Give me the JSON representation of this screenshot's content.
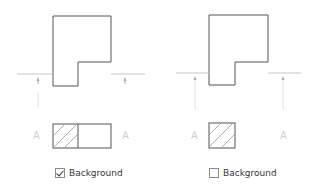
{
  "panels": [
    {
      "id": "with-background",
      "section_label_left": "A",
      "section_label_right": "A",
      "checkbox": {
        "label": "Background",
        "checked": true
      }
    },
    {
      "id": "without-background",
      "section_label_left": "A",
      "section_label_right": "A",
      "checkbox": {
        "label": "Background",
        "checked": false
      }
    }
  ],
  "colors": {
    "outline": "#555555",
    "section_line": "#c8c8c8",
    "label": "#d0d0d0",
    "hatch": "#999999"
  }
}
